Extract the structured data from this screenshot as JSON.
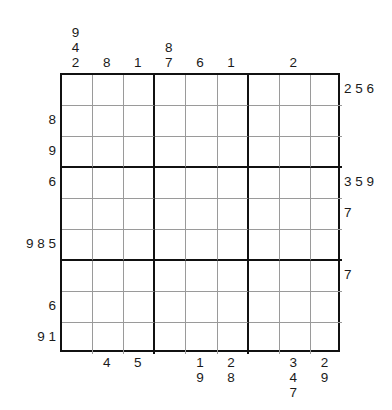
{
  "puzzle": {
    "type": "outside-clue-sudoku",
    "grid_size": 9,
    "box_size": 3,
    "grid_is_empty": true,
    "ink_color": "#111111",
    "thin_line_color": "#9a9a9a",
    "background_color": "#ffffff"
  },
  "grid": {
    "rows": [
      [
        "",
        "",
        "",
        "",
        "",
        "",
        "",
        "",
        ""
      ],
      [
        "",
        "",
        "",
        "",
        "",
        "",
        "",
        "",
        ""
      ],
      [
        "",
        "",
        "",
        "",
        "",
        "",
        "",
        "",
        ""
      ],
      [
        "",
        "",
        "",
        "",
        "",
        "",
        "",
        "",
        ""
      ],
      [
        "",
        "",
        "",
        "",
        "",
        "",
        "",
        "",
        ""
      ],
      [
        "",
        "",
        "",
        "",
        "",
        "",
        "",
        "",
        ""
      ],
      [
        "",
        "",
        "",
        "",
        "",
        "",
        "",
        "",
        ""
      ],
      [
        "",
        "",
        "",
        "",
        "",
        "",
        "",
        "",
        ""
      ],
      [
        "",
        "",
        "",
        "",
        "",
        "",
        "",
        "",
        ""
      ]
    ]
  },
  "clues": {
    "top": [
      {
        "column": 1,
        "values": [
          "9",
          "4",
          "2"
        ],
        "text": "9\n4\n2"
      },
      {
        "column": 2,
        "values": [
          "8"
        ],
        "text": "8"
      },
      {
        "column": 3,
        "values": [
          "1"
        ],
        "text": "1"
      },
      {
        "column": 4,
        "values": [
          "8",
          "7"
        ],
        "text": "8\n7"
      },
      {
        "column": 5,
        "values": [
          "6"
        ],
        "text": "6"
      },
      {
        "column": 6,
        "values": [
          "1"
        ],
        "text": "1"
      },
      {
        "column": 7,
        "values": [],
        "text": ""
      },
      {
        "column": 8,
        "values": [
          "2"
        ],
        "text": "2"
      },
      {
        "column": 9,
        "values": [],
        "text": ""
      }
    ],
    "bottom": [
      {
        "column": 1,
        "values": [],
        "text": ""
      },
      {
        "column": 2,
        "values": [
          "4"
        ],
        "text": "4"
      },
      {
        "column": 3,
        "values": [
          "5"
        ],
        "text": "5"
      },
      {
        "column": 4,
        "values": [],
        "text": ""
      },
      {
        "column": 5,
        "values": [
          "1",
          "9"
        ],
        "text": "1\n9"
      },
      {
        "column": 6,
        "values": [
          "2",
          "8"
        ],
        "text": "2\n8"
      },
      {
        "column": 7,
        "values": [],
        "text": ""
      },
      {
        "column": 8,
        "values": [
          "3",
          "4",
          "7"
        ],
        "text": "3\n4\n7"
      },
      {
        "column": 9,
        "values": [
          "2",
          "9"
        ],
        "text": "2\n9"
      }
    ],
    "left": [
      {
        "row": 1,
        "values": [],
        "text": ""
      },
      {
        "row": 2,
        "values": [
          "8"
        ],
        "text": "8"
      },
      {
        "row": 3,
        "values": [
          "9"
        ],
        "text": "9"
      },
      {
        "row": 4,
        "values": [
          "6"
        ],
        "text": "6"
      },
      {
        "row": 5,
        "values": [],
        "text": ""
      },
      {
        "row": 6,
        "values": [
          "9",
          "8",
          "5"
        ],
        "text": "9 8 5"
      },
      {
        "row": 7,
        "values": [],
        "text": ""
      },
      {
        "row": 8,
        "values": [
          "6"
        ],
        "text": "6"
      },
      {
        "row": 9,
        "values": [
          "9",
          "1"
        ],
        "text": "9 1"
      }
    ],
    "right": [
      {
        "row": 1,
        "values": [
          "2",
          "5",
          "6"
        ],
        "text": "2 5 6"
      },
      {
        "row": 2,
        "values": [],
        "text": ""
      },
      {
        "row": 3,
        "values": [],
        "text": ""
      },
      {
        "row": 4,
        "values": [
          "3",
          "5",
          "9"
        ],
        "text": "3 5 9"
      },
      {
        "row": 5,
        "values": [
          "7"
        ],
        "text": "7"
      },
      {
        "row": 6,
        "values": [],
        "text": ""
      },
      {
        "row": 7,
        "values": [
          "7"
        ],
        "text": "7"
      },
      {
        "row": 8,
        "values": [],
        "text": ""
      },
      {
        "row": 9,
        "values": [],
        "text": ""
      }
    ]
  }
}
